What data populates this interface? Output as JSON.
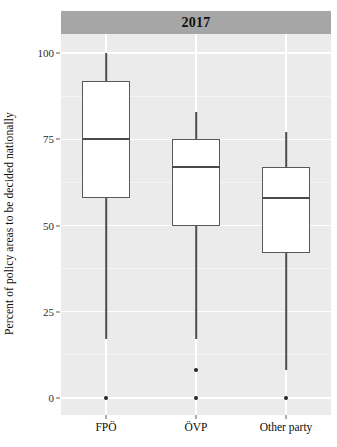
{
  "chart_data": {
    "type": "box",
    "title": "2017",
    "strip_label": "2017",
    "xlabel": "",
    "ylabel": "Percent of policy areas to be decided nationally",
    "categories": [
      "FPÖ",
      "ÖVP",
      "Other party"
    ],
    "ylim": [
      0,
      100
    ],
    "yticks": [
      0,
      25,
      50,
      75,
      100
    ],
    "ytick_labels": [
      "0",
      "25",
      "50",
      "75",
      "100"
    ],
    "grid": "horizontal-major-minor, vertical-major",
    "legend": "none",
    "boxes": [
      {
        "category": "FPÖ",
        "whisker_low": 17,
        "q1": 58,
        "median": 75,
        "q3": 92,
        "whisker_high": 100,
        "outliers": [
          0
        ]
      },
      {
        "category": "ÖVP",
        "whisker_low": 17,
        "q1": 50,
        "median": 67,
        "q3": 75,
        "whisker_high": 83,
        "outliers": [
          8,
          0
        ]
      },
      {
        "category": "Other party",
        "whisker_low": 8,
        "q1": 42,
        "median": 58,
        "q3": 67,
        "whisker_high": 77,
        "outliers": [
          0
        ]
      }
    ],
    "colors": {
      "panel_background": "#ebebeb",
      "grid_major": "#ffffff",
      "strip_background": "#a6a6a6",
      "box_fill": "#ffffff",
      "box_border": "#595959",
      "whisker": "#4d4d4d",
      "outlier": "#262626",
      "text": "#0d0d0d"
    }
  }
}
